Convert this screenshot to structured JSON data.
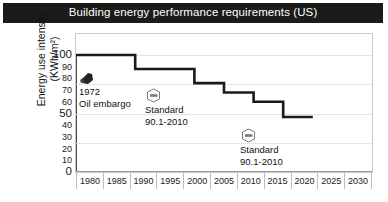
{
  "header": {
    "title": "Building energy performance requirements (US)",
    "bar_color": "#1b1b1b",
    "text_color": "#ffffff"
  },
  "chart_data": {
    "type": "line",
    "subtype": "step",
    "title": "Building energy performance requirements (US)",
    "xlabel": "",
    "ylabel": "Energy use intensity (KWh/m²)",
    "ylabel_line1": "Energy use intensity",
    "ylabel_line2": "(KWh/m²)",
    "xlim": [
      1980,
      2030
    ],
    "ylim": [
      0,
      100
    ],
    "xticks": [
      1980,
      1985,
      1990,
      1995,
      2000,
      2005,
      2010,
      2015,
      2020,
      2025,
      2030
    ],
    "yticks": [
      0,
      10,
      20,
      30,
      40,
      50,
      60,
      70,
      80,
      90,
      100
    ],
    "ytick_major": [
      0,
      50,
      100
    ],
    "grid": "horizontal-light",
    "legend": "none",
    "line_color": "#1a1a1a",
    "series": [
      {
        "name": "Energy use intensity requirement",
        "x": [
          1980,
          1990,
          1990,
          2000,
          2000,
          2005,
          2005,
          2010,
          2010,
          2015,
          2015,
          2020
        ],
        "y": [
          100,
          100,
          88,
          88,
          76,
          76,
          68,
          68,
          60,
          60,
          47,
          47
        ]
      }
    ],
    "steps": [
      {
        "from_year": 1980,
        "to_year": 1990,
        "value": 100
      },
      {
        "from_year": 1990,
        "to_year": 2000,
        "value": 88
      },
      {
        "from_year": 2000,
        "to_year": 2005,
        "value": 76
      },
      {
        "from_year": 2005,
        "to_year": 2010,
        "value": 68
      },
      {
        "from_year": 2010,
        "to_year": 2015,
        "value": 60
      },
      {
        "from_year": 2015,
        "to_year": 2020,
        "value": 47
      }
    ],
    "annotations": [
      {
        "id": "oil-embargo",
        "icon": "oil-drop-icon",
        "line1": "1972",
        "line2": "Oil embargo",
        "x_px": 79,
        "y_px": 72
      },
      {
        "id": "ashrae-standard-upper",
        "icon": "ashrae-logo-icon",
        "line1": "Standard",
        "line2": "90.1-2010",
        "x_px": 145,
        "y_px": 88
      },
      {
        "id": "ashrae-standard-lower",
        "icon": "ashrae-logo-icon",
        "line1": "Standard",
        "line2": "90.1-2010",
        "x_px": 240,
        "y_px": 128
      }
    ]
  },
  "icons": {
    "oil": "oil-drop-icon",
    "ashrae": "ashrae-logo-icon"
  }
}
